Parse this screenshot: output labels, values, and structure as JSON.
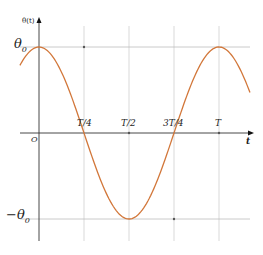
{
  "chart_data": {
    "type": "line",
    "title": "",
    "xlabel": "t",
    "ylabel": "θ(t)",
    "function": "θ(t) = θ0 · cos(2πt / T)",
    "x_ticks": [
      "O",
      "T/4",
      "T/2",
      "3T/4",
      "T"
    ],
    "x_tick_values": [
      0,
      0.25,
      0.5,
      0.75,
      1.0
    ],
    "y_ticks": [
      "θ0",
      "-θ0"
    ],
    "y_tick_values": [
      1,
      -1
    ],
    "xlim": [
      -0.106,
      1.172
    ],
    "ylim": [
      -1,
      1
    ],
    "series": [
      {
        "name": "θ(t)",
        "color": "#d2773a",
        "x": [
          0,
          0.25,
          0.5,
          0.75,
          1.0
        ],
        "values": [
          1,
          0,
          -1,
          0,
          1
        ]
      }
    ],
    "grid": true,
    "legend": "none"
  },
  "labels": {
    "y_axis_title": "θ(t)",
    "x_axis_title": "t",
    "origin": "O",
    "theta0": "θ",
    "theta0_sub": "0",
    "neg_theta0": "−θ",
    "neg_theta0_sub": "0",
    "t_quarter": "T/4",
    "t_half": "T/2",
    "t_three_quarter": "3T/4",
    "t_full": "T"
  },
  "colors": {
    "curve": "#d2773a",
    "axis": "#333333",
    "grid": "#c8c8c8"
  }
}
